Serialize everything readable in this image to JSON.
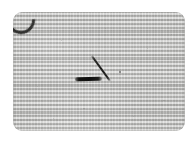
{
  "image": {
    "kind": "photograph",
    "subject": "woven textile swatch with ink marks",
    "caption": "Grayscale photograph of a light gray woven linen panel with rounded corners, bearing a thick horizontal ink stroke and a thinner diagonal ink stroke that together form a check-mark shape, plus a dark crescent defect at the top-left corner.",
    "width_px": "194",
    "height_px": "142",
    "background_color": "#ffffff"
  },
  "panel": {
    "name": "textile-swatch",
    "base_color": "#c9c9c7",
    "edge_color": "#9a9a98",
    "corner_radius_px": "9",
    "left_px": "13",
    "top_px": "12",
    "width_px": "172",
    "height_px": "119",
    "texture": "fine horizontal-dominant woven weave"
  },
  "marks": {
    "ink_color": "#1c1c1a",
    "items": [
      {
        "name": "thick-horizontal-stroke",
        "shape": "bar",
        "length_px": "27",
        "thickness_px": "3.6",
        "angle_deg": "-1.5"
      },
      {
        "name": "thin-diagonal-stroke",
        "shape": "line",
        "length_px": "31",
        "thickness_px": "1.5",
        "angle_deg": "54"
      }
    ]
  },
  "defect": {
    "name": "corner-arc",
    "location": "top-left",
    "color": "#2a2a28"
  },
  "specks": {
    "count": "10",
    "color": "#8a8a88"
  }
}
